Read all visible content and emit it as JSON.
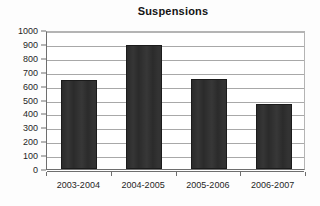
{
  "chart_data": {
    "type": "bar",
    "title": "Suspensions",
    "xlabel": "",
    "ylabel": "",
    "categories": [
      "2003-2004",
      "2004-2005",
      "2005-2006",
      "2006-2007"
    ],
    "values": [
      640,
      890,
      650,
      470
    ],
    "ylim": [
      0,
      1000
    ],
    "ytick_step": 100,
    "yticks": [
      0,
      100,
      200,
      300,
      400,
      500,
      600,
      700,
      800,
      900,
      1000
    ],
    "ytick_labels": [
      "0",
      "100",
      "200",
      "300",
      "400",
      "500",
      "600",
      "700",
      "800",
      "900",
      "1000"
    ],
    "grid": true,
    "grid_axis": "y",
    "legend": false,
    "legend_position": "none",
    "series": [
      {
        "name": "Suspensions",
        "values": [
          640,
          890,
          650,
          470
        ],
        "color": "#2b2b2b"
      }
    ]
  },
  "style": {
    "background_color": "#fdfdfd",
    "plot_background_color": "#ffffff",
    "bar_color": "#2b2b2b",
    "bar_border_color": "#1b1b1b",
    "gridline_color": "#a8a8a8",
    "axis_color": "#6e6e6e",
    "text_color": "#1f1f1f"
  }
}
